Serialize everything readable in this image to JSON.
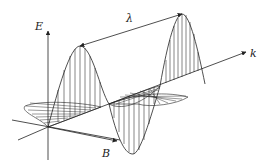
{
  "figure": {
    "labels": {
      "electric_field": "E",
      "magnetic_field": "B",
      "wave_vector": "k",
      "wavelength": "λ"
    },
    "colors": {
      "line": "#222222",
      "background": "#ffffff"
    }
  }
}
